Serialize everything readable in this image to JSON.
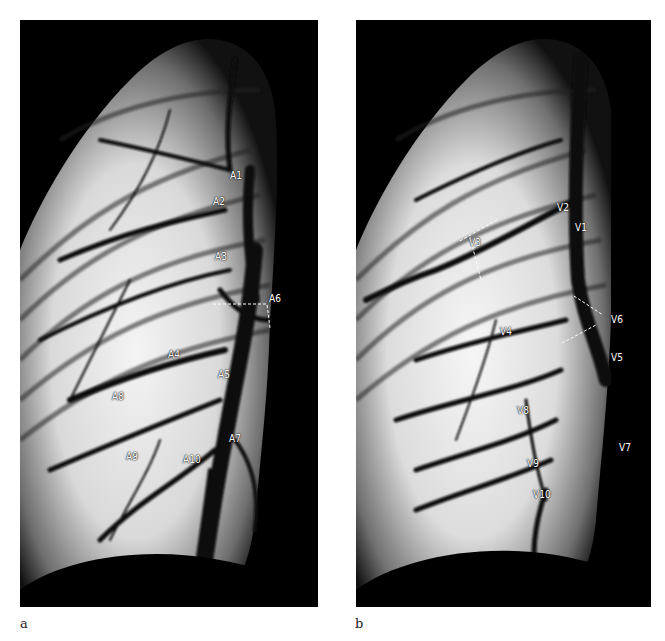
{
  "figure": {
    "panels": [
      {
        "id": "a",
        "caption": "a",
        "labels": [
          {
            "text": "A1",
            "x": 230,
            "y": 171
          },
          {
            "text": "A2",
            "x": 213,
            "y": 197
          },
          {
            "text": "A3",
            "x": 215,
            "y": 252
          },
          {
            "text": "A6",
            "x": 269,
            "y": 294
          },
          {
            "text": "A4",
            "x": 168,
            "y": 350
          },
          {
            "text": "A5",
            "x": 218,
            "y": 370
          },
          {
            "text": "A8",
            "x": 112,
            "y": 392
          },
          {
            "text": "A7",
            "x": 229,
            "y": 434
          },
          {
            "text": "A9",
            "x": 126,
            "y": 452
          },
          {
            "text": "A10",
            "x": 183,
            "y": 455
          }
        ]
      },
      {
        "id": "b",
        "caption": "b",
        "labels": [
          {
            "text": "V2",
            "x": 557,
            "y": 203
          },
          {
            "text": "V1",
            "x": 575,
            "y": 223
          },
          {
            "text": "V3",
            "x": 469,
            "y": 238
          },
          {
            "text": "V6",
            "x": 611,
            "y": 315
          },
          {
            "text": "V4",
            "x": 500,
            "y": 327
          },
          {
            "text": "V5",
            "x": 611,
            "y": 353
          },
          {
            "text": "V8",
            "x": 517,
            "y": 406
          },
          {
            "text": "V7",
            "x": 619,
            "y": 443
          },
          {
            "text": "V9",
            "x": 527,
            "y": 459
          },
          {
            "text": "V10",
            "x": 533,
            "y": 490
          }
        ]
      }
    ]
  }
}
